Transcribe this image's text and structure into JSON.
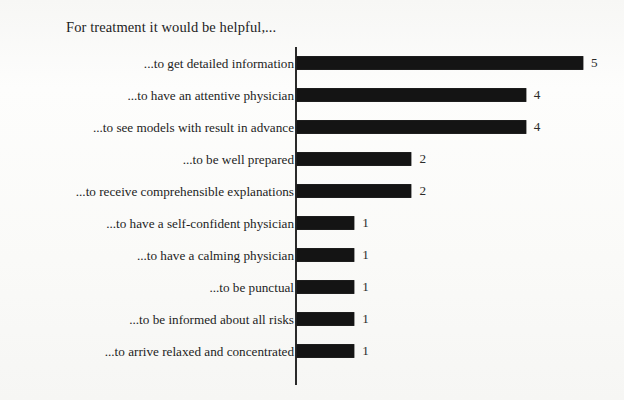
{
  "chart_data": {
    "type": "bar",
    "orientation": "horizontal",
    "title": "For treatment it would be helpful,...",
    "xlabel": "",
    "ylabel": "",
    "xlim": [
      0,
      5
    ],
    "grid": false,
    "legend": false,
    "value_labels_shown": true,
    "axis_line": "category-axis-only",
    "categories": [
      "...to get detailed information",
      "...to have an attentive physician",
      "...to see models with result in advance",
      "...to be well prepared",
      "...to receive comprehensible explanations",
      "...to have a self-confident physician",
      "...to have a calming physician",
      "...to be punctual",
      "...to be informed about all risks",
      "...to arrive relaxed and concentrated"
    ],
    "values": [
      5,
      4,
      4,
      2,
      2,
      1,
      1,
      1,
      1,
      1
    ],
    "value_label_texts": [
      "5",
      "4",
      "4",
      "2",
      "2",
      "1",
      "1",
      "1",
      "1",
      "1"
    ],
    "colors": {
      "bar": "#141414",
      "axis": "#2a2a2a",
      "text": "#1d1d1d",
      "background": "#fbfbfa"
    }
  }
}
